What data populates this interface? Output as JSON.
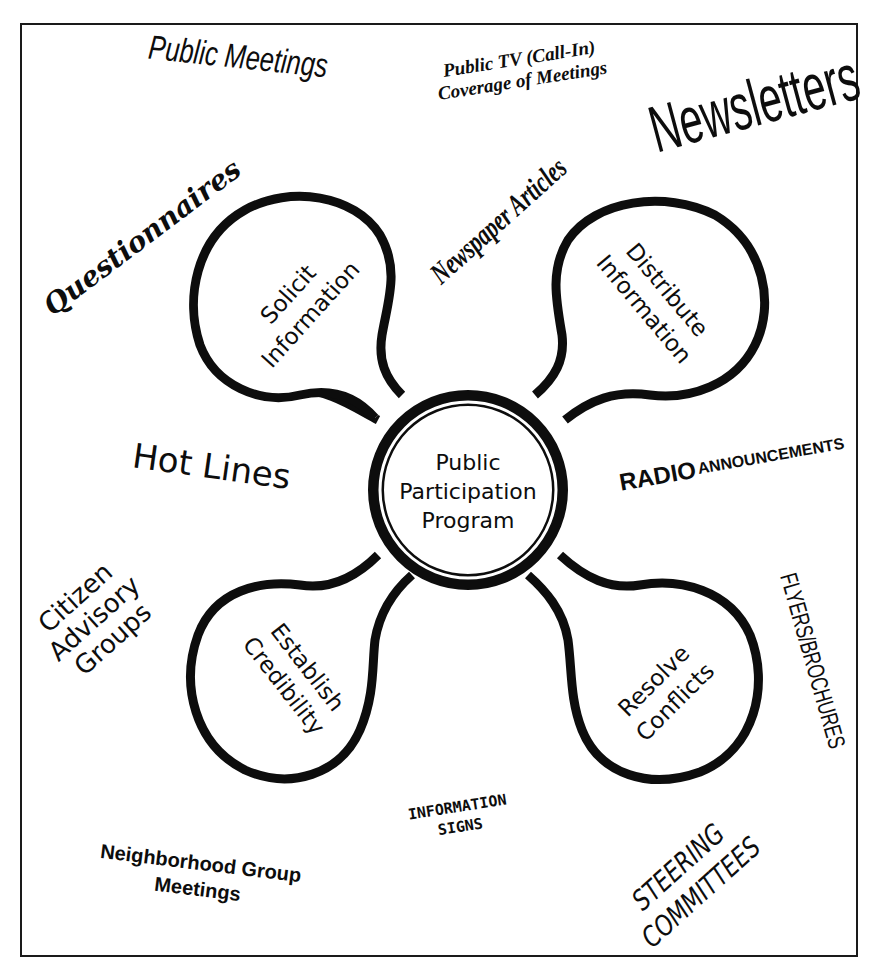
{
  "diagram": {
    "center": {
      "line1": "Public",
      "line2": "Participation",
      "line3": "Program"
    },
    "lobes": {
      "top_left": {
        "line1": "Solicit",
        "line2": "Information"
      },
      "top_right": {
        "line1": "Distribute",
        "line2": "Information"
      },
      "bottom_left": {
        "line1": "Establish",
        "line2": "Credibility"
      },
      "bottom_right": {
        "line1": "Resolve",
        "line2": "Conflicts"
      }
    },
    "methods": {
      "public_meetings": "Public Meetings",
      "public_tv": {
        "line1": "Public TV (Call-In)",
        "line2": "Coverage of Meetings"
      },
      "newsletters": "Newsletters",
      "questionnaires": "Questionnaires",
      "newspaper_articles": "Newspaper Articles",
      "hot_lines": "Hot Lines",
      "radio_announcements": {
        "word1": "RADIO",
        "word2": "ANNOUNCEMENTS"
      },
      "citizen_advisory_groups": {
        "line1": "Citizen",
        "line2": "Advisory",
        "line3": "Groups"
      },
      "flyers_brochures": "FLYERS/BROCHURES",
      "information_signs": {
        "line1": "INFORMATION",
        "line2": "SIGNS"
      },
      "neighborhood_group_meetings": {
        "line1": "Neighborhood Group",
        "line2": "Meetings"
      },
      "steering_committees": {
        "line1": "STEERING",
        "line2": "COMMITTEES"
      }
    }
  }
}
